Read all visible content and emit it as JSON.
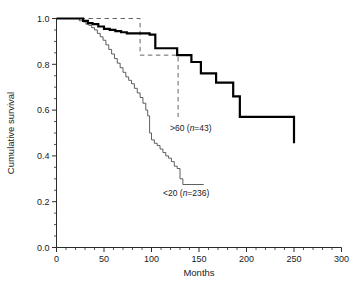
{
  "chart_data": {
    "type": "line",
    "title": "",
    "xlabel": "Months",
    "ylabel": "Cumulative survival",
    "xlim": [
      0,
      300
    ],
    "ylim": [
      0.0,
      1.0
    ],
    "xticks": [
      0,
      50,
      100,
      150,
      200,
      250,
      300
    ],
    "xtick_labels": [
      "0",
      "50",
      "100",
      "150",
      "200",
      "250",
      "300"
    ],
    "x_minor_tick_step": 10,
    "yticks": [
      0.0,
      0.2,
      0.4,
      0.6,
      0.8,
      1.0
    ],
    "ytick_labels": [
      "0.0",
      "0.2",
      "0.4",
      "0.6",
      "0.8",
      "1.0"
    ],
    "y_minor_tick_step": 0.05,
    "grid": false,
    "legend_position": "inline-annotations",
    "step_type": "post",
    "series": [
      {
        "name": "20-60 (n=220)",
        "label_text": "20–60 (",
        "label_italic": "n",
        "label_tail": "=220)",
        "style": "solid-thick",
        "color": "#000000",
        "line_width": 2.2,
        "x": [
          0,
          22,
          28,
          33,
          38,
          44,
          50,
          56,
          62,
          68,
          74,
          86,
          98,
          104,
          122,
          127,
          134,
          142,
          152,
          160,
          168,
          186,
          193,
          250
        ],
        "y": [
          1.0,
          1.0,
          0.99,
          0.98,
          0.975,
          0.965,
          0.955,
          0.95,
          0.945,
          0.94,
          0.935,
          0.935,
          0.93,
          0.87,
          0.87,
          0.84,
          0.84,
          0.81,
          0.76,
          0.76,
          0.72,
          0.66,
          0.57,
          0.455
        ]
      },
      {
        "name": "<20 (n=236)",
        "label_text": "<20 (",
        "label_italic": "n",
        "label_tail": "=236)",
        "style": "solid-thin",
        "color": "#4d4d4d",
        "line_width": 0.9,
        "x": [
          0,
          20,
          24,
          28,
          31,
          34,
          37,
          40,
          43,
          46,
          49,
          52,
          55,
          58,
          61,
          64,
          67,
          70,
          73,
          76,
          79,
          82,
          85,
          88,
          91,
          94,
          96,
          98,
          100,
          103,
          106,
          109,
          112,
          115,
          118,
          121,
          124,
          127,
          130,
          133,
          155
        ],
        "y": [
          1.0,
          1.0,
          0.99,
          0.985,
          0.975,
          0.97,
          0.96,
          0.95,
          0.935,
          0.92,
          0.905,
          0.885,
          0.865,
          0.845,
          0.825,
          0.805,
          0.785,
          0.765,
          0.745,
          0.73,
          0.715,
          0.695,
          0.675,
          0.655,
          0.63,
          0.6,
          0.575,
          0.5,
          0.47,
          0.455,
          0.445,
          0.43,
          0.415,
          0.4,
          0.39,
          0.375,
          0.355,
          0.345,
          0.3,
          0.275,
          0.275
        ]
      },
      {
        "name": ">60 (n=43)",
        "label_text": ">60 (",
        "label_italic": "n",
        "label_tail": "=43)",
        "style": "dashed",
        "color": "#555555",
        "line_width": 0.9,
        "x": [
          0,
          74,
          88,
          127,
          128
        ],
        "y": [
          1.0,
          1.0,
          0.84,
          0.84,
          0.57
        ]
      }
    ],
    "annotations": [
      {
        "id": "label-gt60",
        "text": ">60 (n=43)",
        "x_px": 170,
        "y_px": 131
      },
      {
        "id": "label-20-60",
        "text": "20–60 (n=220)",
        "x_px": 247,
        "y_px": 133
      },
      {
        "id": "label-lt20",
        "text": "<20 (n=236)",
        "x_px": 163,
        "y_px": 196
      }
    ]
  },
  "axis": {
    "xlabel": "Months",
    "ylabel": "Cumulative survival"
  }
}
